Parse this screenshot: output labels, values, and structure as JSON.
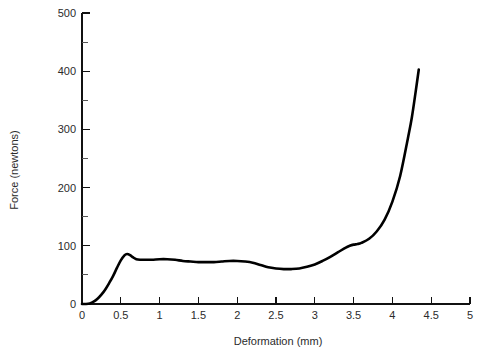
{
  "chart_data": {
    "type": "line",
    "title": "",
    "xlabel": "Deformation (mm)",
    "ylabel": "Force (newtons)",
    "xlim": [
      0,
      5
    ],
    "ylim": [
      0,
      500
    ],
    "grid": false,
    "legend": false,
    "legend_position": "none",
    "x_ticks": [
      0,
      0.5,
      1,
      1.5,
      2,
      2.5,
      3,
      3.5,
      4,
      4.5,
      5
    ],
    "x_tick_labels": [
      "0",
      "0.5",
      "1",
      "1.5",
      "2",
      "2.5",
      "3",
      "3.5",
      "4",
      "4.5",
      "5"
    ],
    "y_ticks": [
      0,
      100,
      200,
      300,
      400,
      500
    ],
    "y_tick_labels": [
      "0",
      "100",
      "200",
      "300",
      "400",
      "500"
    ],
    "y_minor_ticks": [
      50,
      150,
      250,
      350,
      450
    ],
    "series": [
      {
        "name": "Force vs Deformation",
        "color": "#000000",
        "x": [
          0.0,
          0.05,
          0.1,
          0.15,
          0.2,
          0.25,
          0.3,
          0.35,
          0.4,
          0.45,
          0.5,
          0.55,
          0.58,
          0.62,
          0.66,
          0.7,
          0.75,
          0.8,
          0.9,
          1.0,
          1.1,
          1.2,
          1.3,
          1.4,
          1.5,
          1.6,
          1.7,
          1.8,
          1.9,
          2.0,
          2.1,
          2.2,
          2.3,
          2.4,
          2.5,
          2.6,
          2.7,
          2.8,
          2.9,
          3.0,
          3.1,
          3.2,
          3.3,
          3.4,
          3.45,
          3.5,
          3.55,
          3.6,
          3.7,
          3.8,
          3.9,
          4.0,
          4.1,
          4.2,
          4.25,
          4.3,
          4.34
        ],
        "y": [
          0,
          0,
          1,
          4,
          9,
          16,
          25,
          36,
          48,
          62,
          75,
          84,
          86,
          84,
          80,
          77,
          76,
          76,
          76,
          77,
          77,
          76,
          74,
          73,
          72,
          72,
          72,
          73,
          74,
          74,
          73,
          71,
          67,
          63,
          61,
          60,
          60,
          61,
          64,
          68,
          74,
          81,
          89,
          97,
          100,
          102,
          103,
          105,
          112,
          125,
          145,
          176,
          220,
          285,
          320,
          365,
          403
        ]
      }
    ]
  },
  "axes": {
    "x_axis_name": "x-axis",
    "y_axis_name": "y-axis"
  }
}
